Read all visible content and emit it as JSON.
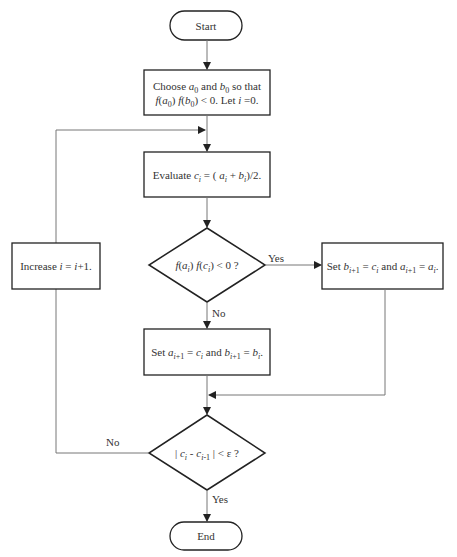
{
  "colors": {
    "background": "#ffffff",
    "stroke": "#222222",
    "connector": "#777777",
    "text": "#333333"
  },
  "nodes": {
    "start": {
      "type": "terminator",
      "label": "Start"
    },
    "init": {
      "type": "process",
      "line1": "Choose a0 and b0 so that",
      "line2": "f(a0) f(b0) < 0. Let i = 0."
    },
    "evaluate": {
      "type": "process",
      "label": "Evaluate ci = (ai + bi)/2."
    },
    "decision_sign": {
      "type": "decision",
      "label": "f(ai) f(ci) < 0 ?"
    },
    "set_b": {
      "type": "process",
      "label": "Set bi+1 = ci and ai+1 = ai."
    },
    "set_a": {
      "type": "process",
      "label": "Set ai+1 = ci and bi+1 = bi."
    },
    "increase": {
      "type": "process",
      "label": "Increase i = i+1."
    },
    "decision_conv": {
      "type": "decision",
      "label": "|ci - ci-1| < ε ?"
    },
    "end": {
      "type": "terminator",
      "label": "End"
    }
  },
  "edges": [
    {
      "from": "start",
      "to": "init",
      "label": ""
    },
    {
      "from": "init",
      "to": "evaluate",
      "label": ""
    },
    {
      "from": "evaluate",
      "to": "decision_sign",
      "label": ""
    },
    {
      "from": "decision_sign",
      "to": "set_b",
      "label": "Yes"
    },
    {
      "from": "decision_sign",
      "to": "set_a",
      "label": "No"
    },
    {
      "from": "set_b",
      "to": "decision_conv",
      "label": ""
    },
    {
      "from": "set_a",
      "to": "decision_conv",
      "label": ""
    },
    {
      "from": "decision_conv",
      "to": "end",
      "label": "Yes"
    },
    {
      "from": "decision_conv",
      "to": "increase",
      "label": "No"
    },
    {
      "from": "increase",
      "to": "evaluate",
      "label": ""
    }
  ],
  "edge_labels": {
    "sign_yes": "Yes",
    "sign_no": "No",
    "conv_yes": "Yes",
    "conv_no": "No"
  },
  "text": {
    "start": "Start",
    "end": "End",
    "choose_word": "Choose",
    "and_word": "and",
    "so_that": "so that",
    "let_word": "Let",
    "evaluate_word": "Evaluate",
    "set_word": "Set",
    "increase_word": "Increase"
  }
}
